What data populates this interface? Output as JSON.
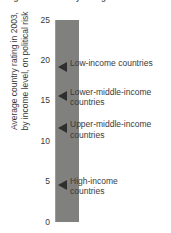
{
  "figure": {
    "title": "Figure 4.2   Country ratings"
  },
  "axis": {
    "y_label_line1": "Average country rating in 2003,",
    "y_label_line2": "by income level, on political risk",
    "ticks": [
      "25",
      "20",
      "15",
      "10",
      "5",
      "0"
    ]
  },
  "annotations": [
    {
      "label": "Low-income countries",
      "value": 19.0
    },
    {
      "label": "Lower-middle-income\ncountries",
      "value": 15.5
    },
    {
      "label": "Upper-middle-income\ncountries",
      "value": 11.5
    },
    {
      "label": "High-income\ncountries",
      "value": 4.5
    }
  ],
  "colors": {
    "bar": "#80807E",
    "text": "#3A3A3A",
    "arrow": "#2F2F2F",
    "background": "#FFFFFF"
  },
  "chart_data": {
    "type": "bar",
    "title": "Figure 4.2   Country ratings",
    "xlabel": "",
    "ylabel": "Average country rating in 2003, by income level, on political risk",
    "ylim": [
      0,
      25
    ],
    "yticks": [
      0,
      5,
      10,
      15,
      20,
      25
    ],
    "grid": false,
    "legend": "none",
    "orientation": "vertical",
    "categories": [
      "Country rating scale"
    ],
    "values": [
      25
    ],
    "annotations": [
      {
        "label": "Low-income countries",
        "value": 19.0
      },
      {
        "label": "Lower-middle-income countries",
        "value": 15.5
      },
      {
        "label": "Upper-middle-income countries",
        "value": 11.5
      },
      {
        "label": "High-income countries",
        "value": 4.5
      }
    ]
  }
}
